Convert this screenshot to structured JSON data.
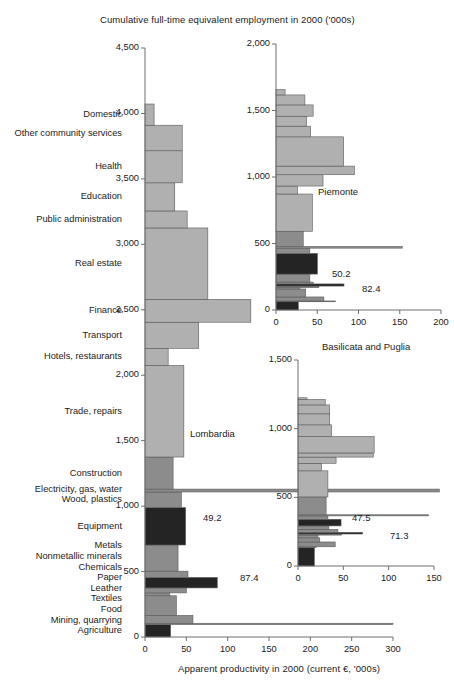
{
  "figure": {
    "top_title": "Cumulative full-time equivalent employment in 2000 ('000s)",
    "bottom_title": "Apparent productivity in 2000 (current €, '000s)",
    "colors": {
      "light": "#b0b0b0",
      "medium": "#8c8c8c",
      "dark": "#242424",
      "axis": "#6e6e6e",
      "edge": "#5a5a5a",
      "text": "#1a1a1a",
      "background": "#ffffff"
    }
  },
  "categories": [
    "Domestic",
    "Other community services",
    "Health",
    "Education",
    "Public administration",
    "Real estate",
    "Finance",
    "Transport",
    "Hotels, restaurants",
    "Trade, repairs",
    "Construction",
    "Electricity, gas, water",
    "Wood, plastics",
    "Equipment",
    "Metals",
    "Nonmetallic minerals",
    "Chemicals",
    "Paper",
    "Leather",
    "Textiles",
    "Food",
    "Mining, quarrying",
    "Agriculture"
  ],
  "chart_data": [
    {
      "id": "lombardia",
      "type": "bar",
      "orientation": "marimekko-horizontal",
      "title": "Lombardia",
      "xlabel": "Apparent productivity in 2000 (current €, '000s)",
      "ylabel": "Cumulative full-time equivalent employment in 2000 ('000s)",
      "xlim": [
        0,
        300
      ],
      "ylim": [
        0,
        4500
      ],
      "xticks": [
        0,
        50,
        100,
        150,
        200,
        250,
        300
      ],
      "xticklabels": [
        "0",
        "50",
        "100",
        "150",
        "200",
        "250",
        "300"
      ],
      "yticks": [
        0,
        500,
        1000,
        1500,
        2000,
        2500,
        3000,
        3500,
        4000,
        4500
      ],
      "yticklabels": [
        "0",
        "500",
        "1,000",
        "1,500",
        "2,000",
        "2,500",
        "3,000",
        "3,500",
        "4,000",
        "4,500"
      ],
      "grid": false,
      "legend": "none",
      "value_labels": [
        {
          "category": "Equipment",
          "text": "49.2"
        },
        {
          "category": "Chemicals",
          "text": "87.4"
        }
      ],
      "bars": [
        {
          "category": "Domestic",
          "productivity": 11,
          "employment": 162,
          "shade": "light"
        },
        {
          "category": "Other community services",
          "productivity": 45,
          "employment": 195,
          "shade": "light"
        },
        {
          "category": "Health",
          "productivity": 45,
          "employment": 245,
          "shade": "light"
        },
        {
          "category": "Education",
          "productivity": 36,
          "employment": 215,
          "shade": "light"
        },
        {
          "category": "Public administration",
          "productivity": 51,
          "employment": 130,
          "shade": "light"
        },
        {
          "category": "Real estate",
          "productivity": 76,
          "employment": 545,
          "shade": "light"
        },
        {
          "category": "Finance",
          "productivity": 128,
          "employment": 175,
          "shade": "light"
        },
        {
          "category": "Transport",
          "productivity": 65,
          "employment": 200,
          "shade": "light"
        },
        {
          "category": "Hotels, restaurants",
          "productivity": 28,
          "employment": 130,
          "shade": "light"
        },
        {
          "category": "Trade, repairs",
          "productivity": 47,
          "employment": 700,
          "shade": "light"
        },
        {
          "category": "Construction",
          "productivity": 34,
          "employment": 245,
          "shade": "medium"
        },
        {
          "category": "Electricity, gas, water",
          "productivity": 356,
          "employment": 22,
          "shade": "medium"
        },
        {
          "category": "Wood, plastics",
          "productivity": 44,
          "employment": 120,
          "shade": "medium"
        },
        {
          "category": "Equipment",
          "productivity": 49.2,
          "employment": 285,
          "shade": "dark"
        },
        {
          "category": "Metals",
          "productivity": 40,
          "employment": 200,
          "shade": "medium"
        },
        {
          "category": "Nonmetallic minerals",
          "productivity": 52,
          "employment": 48,
          "shade": "medium"
        },
        {
          "category": "Chemicals",
          "productivity": 87.4,
          "employment": 80,
          "shade": "dark"
        },
        {
          "category": "Paper",
          "productivity": 50,
          "employment": 38,
          "shade": "medium"
        },
        {
          "category": "Leather",
          "productivity": 30,
          "employment": 22,
          "shade": "medium"
        },
        {
          "category": "Textiles",
          "productivity": 38,
          "employment": 150,
          "shade": "medium"
        },
        {
          "category": "Food",
          "productivity": 58,
          "employment": 60,
          "shade": "medium"
        },
        {
          "category": "Mining, quarrying",
          "productivity": 300,
          "employment": 10,
          "shade": "medium"
        },
        {
          "category": "Agriculture",
          "productivity": 31,
          "employment": 95,
          "shade": "dark"
        }
      ]
    },
    {
      "id": "piemonte",
      "type": "bar",
      "orientation": "marimekko-horizontal",
      "title": "Piemonte",
      "xlim": [
        0,
        200
      ],
      "ylim": [
        0,
        2000
      ],
      "xticks": [
        0,
        50,
        100,
        150,
        200
      ],
      "xticklabels": [
        "0",
        "50",
        "100",
        "150",
        "200"
      ],
      "yticks": [
        0,
        500,
        1000,
        1500,
        2000
      ],
      "yticklabels": [
        "0",
        "500",
        "1,000",
        "1,500",
        "2,000"
      ],
      "grid": false,
      "legend": "none",
      "value_labels": [
        {
          "category": "Equipment",
          "text": "50.2"
        },
        {
          "category": "Chemicals",
          "text": "82.4"
        }
      ],
      "bars": [
        {
          "category": "Domestic",
          "productivity": 11,
          "employment": 40,
          "shade": "light"
        },
        {
          "category": "Other community services",
          "productivity": 35,
          "employment": 75,
          "shade": "light"
        },
        {
          "category": "Health",
          "productivity": 45,
          "employment": 85,
          "shade": "light"
        },
        {
          "category": "Education",
          "productivity": 37,
          "employment": 75,
          "shade": "light"
        },
        {
          "category": "Public administration",
          "productivity": 42,
          "employment": 80,
          "shade": "light"
        },
        {
          "category": "Real estate",
          "productivity": 82,
          "employment": 220,
          "shade": "light"
        },
        {
          "category": "Finance",
          "productivity": 95,
          "employment": 65,
          "shade": "light"
        },
        {
          "category": "Transport",
          "productivity": 57,
          "employment": 85,
          "shade": "light"
        },
        {
          "category": "Hotels, restaurants",
          "productivity": 26,
          "employment": 60,
          "shade": "light"
        },
        {
          "category": "Trade, repairs",
          "productivity": 44,
          "employment": 280,
          "shade": "light"
        },
        {
          "category": "Construction",
          "productivity": 33,
          "employment": 115,
          "shade": "medium"
        },
        {
          "category": "Electricity, gas, water",
          "productivity": 153,
          "employment": 12,
          "shade": "medium"
        },
        {
          "category": "Wood, plastics",
          "productivity": 41,
          "employment": 40,
          "shade": "medium"
        },
        {
          "category": "Equipment",
          "productivity": 50.2,
          "employment": 155,
          "shade": "dark"
        },
        {
          "category": "Metals",
          "productivity": 41,
          "employment": 60,
          "shade": "medium"
        },
        {
          "category": "Nonmetallic minerals",
          "productivity": 45,
          "employment": 14,
          "shade": "medium"
        },
        {
          "category": "Chemicals",
          "productivity": 82.4,
          "employment": 16,
          "shade": "dark"
        },
        {
          "category": "Paper",
          "productivity": 52,
          "employment": 12,
          "shade": "medium"
        },
        {
          "category": "Leather",
          "productivity": 29,
          "employment": 10,
          "shade": "medium"
        },
        {
          "category": "Textiles",
          "productivity": 36,
          "employment": 60,
          "shade": "medium"
        },
        {
          "category": "Food",
          "productivity": 58,
          "employment": 30,
          "shade": "medium"
        },
        {
          "category": "Mining, quarrying",
          "productivity": 72,
          "employment": 6,
          "shade": "medium"
        },
        {
          "category": "Agriculture",
          "productivity": 27,
          "employment": 62,
          "shade": "dark"
        }
      ]
    },
    {
      "id": "basilicata-puglia",
      "type": "bar",
      "orientation": "marimekko-horizontal",
      "title": "Basilicata and Puglia",
      "xlim": [
        0,
        150
      ],
      "ylim": [
        0,
        1500
      ],
      "xticks": [
        0,
        50,
        100,
        150
      ],
      "xticklabels": [
        "0",
        "50",
        "100",
        "150"
      ],
      "yticks": [
        0,
        500,
        1000,
        1500
      ],
      "yticklabels": [
        "0",
        "500",
        "1,000",
        "1,500"
      ],
      "grid": false,
      "legend": "none",
      "value_labels": [
        {
          "category": "Equipment",
          "text": "47.5"
        },
        {
          "category": "Chemicals",
          "text": "71.3"
        }
      ],
      "bars": [
        {
          "category": "Domestic",
          "productivity": 10,
          "employment": 12,
          "shade": "light"
        },
        {
          "category": "Other community services",
          "productivity": 30,
          "employment": 40,
          "shade": "light"
        },
        {
          "category": "Health",
          "productivity": 35,
          "employment": 65,
          "shade": "light"
        },
        {
          "category": "Education",
          "productivity": 35,
          "employment": 80,
          "shade": "light"
        },
        {
          "category": "Public administration",
          "productivity": 37,
          "employment": 85,
          "shade": "light"
        },
        {
          "category": "Real estate",
          "productivity": 84,
          "employment": 120,
          "shade": "light"
        },
        {
          "category": "Finance",
          "productivity": 83,
          "employment": 30,
          "shade": "light"
        },
        {
          "category": "Transport",
          "productivity": 42,
          "employment": 45,
          "shade": "light"
        },
        {
          "category": "Hotels, restaurants",
          "productivity": 26,
          "employment": 55,
          "shade": "light"
        },
        {
          "category": "Trade, repairs",
          "productivity": 33,
          "employment": 190,
          "shade": "light"
        },
        {
          "category": "Construction",
          "productivity": 31,
          "employment": 130,
          "shade": "medium"
        },
        {
          "category": "Electricity, gas, water",
          "productivity": 144,
          "employment": 8,
          "shade": "medium"
        },
        {
          "category": "Wood, plastics",
          "productivity": 33,
          "employment": 25,
          "shade": "medium"
        },
        {
          "category": "Equipment",
          "productivity": 47.5,
          "employment": 48,
          "shade": "dark"
        },
        {
          "category": "Metals",
          "productivity": 34,
          "employment": 25,
          "shade": "medium"
        },
        {
          "category": "Nonmetallic minerals",
          "productivity": 44,
          "employment": 22,
          "shade": "medium"
        },
        {
          "category": "Chemicals",
          "productivity": 71.3,
          "employment": 12,
          "shade": "dark"
        },
        {
          "category": "Paper",
          "productivity": 48,
          "employment": 8,
          "shade": "medium"
        },
        {
          "category": "Leather",
          "productivity": 22,
          "employment": 20,
          "shade": "medium"
        },
        {
          "category": "Textiles",
          "productivity": 24,
          "employment": 30,
          "shade": "medium"
        },
        {
          "category": "Food",
          "productivity": 41,
          "employment": 35,
          "shade": "medium"
        },
        {
          "category": "Mining, quarrying",
          "productivity": 20,
          "employment": 5,
          "shade": "medium"
        },
        {
          "category": "Agriculture",
          "productivity": 18,
          "employment": 135,
          "shade": "dark"
        }
      ]
    }
  ]
}
